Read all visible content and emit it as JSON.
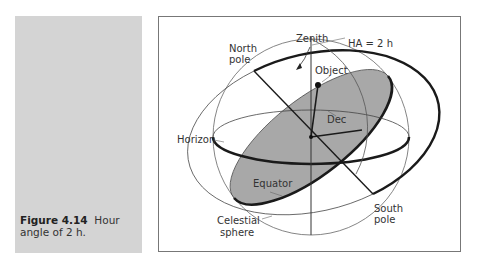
{
  "caption": {
    "figure_number": "Figure 4.14",
    "text_line1": "Hour",
    "text_line2": "angle of 2 h."
  },
  "diagram": {
    "labels": {
      "north_pole_1": "North",
      "north_pole_2": "pole",
      "zenith": "Zenith",
      "hour_angle": "HA = 2 h",
      "object": "Object",
      "dec": "Dec",
      "horizon": "Horizon",
      "equator": "Equator",
      "celestial_sphere_1": "Celestial",
      "celestial_sphere_2": "sphere",
      "south_pole_1": "South",
      "south_pole_2": "pole"
    },
    "colors": {
      "equator_fill": "#a8a8a8",
      "panel": "#d4d4d4",
      "lines": "#222222"
    }
  }
}
